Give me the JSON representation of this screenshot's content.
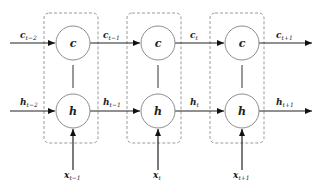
{
  "diagram": {
    "cells": [
      {
        "node_c": "c",
        "node_h": "h",
        "input": {
          "base": "x",
          "sub": "t−1"
        }
      },
      {
        "node_c": "c",
        "node_h": "h",
        "input": {
          "base": "x",
          "sub": "t"
        }
      },
      {
        "node_c": "c",
        "node_h": "h",
        "input": {
          "base": "x",
          "sub": "t+1"
        }
      }
    ],
    "c_edges": [
      {
        "base": "c",
        "sub": "t−2"
      },
      {
        "base": "c",
        "sub": "t−1"
      },
      {
        "base": "c",
        "sub": "t"
      },
      {
        "base": "c",
        "sub": "t+1"
      }
    ],
    "h_edges": [
      {
        "base": "h",
        "sub": "t−2"
      },
      {
        "base": "h",
        "sub": "t−1"
      },
      {
        "base": "h",
        "sub": "t"
      },
      {
        "base": "h",
        "sub": "t+1"
      }
    ],
    "colors": {
      "box_stroke": "#9a9a9a",
      "node_stroke": "#8c8c8c",
      "edge": "#222222"
    }
  }
}
